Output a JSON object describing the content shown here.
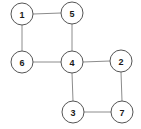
{
  "figure": {
    "title": "",
    "background_color": "#ffffff",
    "width": 141,
    "height": 129
  },
  "graph": {
    "type": "undirected-node-link-diagram",
    "node_style": {
      "shape": "circle",
      "radius": 11,
      "fill_color": "#ffffff",
      "stroke_color": "#555555",
      "stroke_width": 1,
      "label_color": "#1a1a1a",
      "label_font_size": 9,
      "label_font_weight": "bold"
    },
    "edge_style": {
      "stroke_color": "#8c8c8c",
      "stroke_width": 1
    },
    "nodes": [
      {
        "id": "1",
        "label": "1",
        "x": 22,
        "y": 14,
        "degree": 2
      },
      {
        "id": "5",
        "label": "5",
        "x": 72,
        "y": 13,
        "degree": 2
      },
      {
        "id": "6",
        "label": "6",
        "x": 22,
        "y": 62,
        "degree": 2
      },
      {
        "id": "4",
        "label": "4",
        "x": 72,
        "y": 62,
        "degree": 4
      },
      {
        "id": "2",
        "label": "2",
        "x": 121,
        "y": 61,
        "degree": 2
      },
      {
        "id": "3",
        "label": "3",
        "x": 73,
        "y": 112,
        "degree": 2
      },
      {
        "id": "7",
        "label": "7",
        "x": 122,
        "y": 112,
        "degree": 2
      }
    ],
    "edges": [
      {
        "source": "1",
        "target": "5",
        "x1": 33,
        "y1": 14,
        "x2": 61,
        "y2": 13
      },
      {
        "source": "1",
        "target": "6",
        "x1": 22,
        "y1": 25,
        "x2": 22,
        "y2": 51
      },
      {
        "source": "5",
        "target": "4",
        "x1": 72,
        "y1": 24,
        "x2": 72,
        "y2": 51
      },
      {
        "source": "6",
        "target": "4",
        "x1": 33,
        "y1": 62,
        "x2": 61,
        "y2": 62
      },
      {
        "source": "4",
        "target": "2",
        "x1": 83,
        "y1": 62,
        "x2": 110,
        "y2": 61
      },
      {
        "source": "4",
        "target": "3",
        "x1": 72,
        "y1": 73,
        "x2": 73,
        "y2": 101
      },
      {
        "source": "2",
        "target": "7",
        "x1": 121,
        "y1": 72,
        "x2": 122,
        "y2": 101
      },
      {
        "source": "3",
        "target": "7",
        "x1": 84,
        "y1": 112,
        "x2": 111,
        "y2": 112
      }
    ]
  }
}
